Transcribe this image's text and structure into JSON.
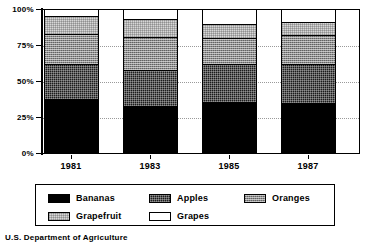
{
  "chart_data": {
    "type": "bar",
    "subtype": "stacked-percent",
    "title": "",
    "subtitle": "",
    "xlabel": "",
    "ylabel": "",
    "categories": [
      "1981",
      "1983",
      "1985",
      "1987"
    ],
    "ylim": [
      0,
      100
    ],
    "yticks": [
      0,
      25,
      50,
      75,
      100
    ],
    "ytick_labels": [
      "0%",
      "25%",
      "50%",
      "75%",
      "100%"
    ],
    "grid": true,
    "grid_axis": "y",
    "legend_position": "bottom",
    "series": [
      {
        "name": "Bananas",
        "color": "#000000",
        "pattern": "solid",
        "values": [
          38,
          33,
          36,
          35
        ]
      },
      {
        "name": "Apples",
        "color": "#1c1c1c",
        "pattern": "dense-dither",
        "values": [
          24,
          25,
          26,
          27
        ]
      },
      {
        "name": "Oranges",
        "color": "#8d8d8d",
        "pattern": "mid-dither",
        "values": [
          21,
          23,
          18,
          20
        ]
      },
      {
        "name": "Grapefruit",
        "color": "#d7d7d7",
        "pattern": "light-dither",
        "values": [
          12,
          12,
          10,
          9
        ]
      },
      {
        "name": "Grapes",
        "color": "#ffffff",
        "pattern": "none",
        "values": [
          5,
          7,
          10,
          9
        ]
      }
    ],
    "annotations": [
      "U.S. Department of Agriculture"
    ]
  },
  "axis": {
    "y_labels": [
      "100%",
      "75%",
      "50%",
      "25%",
      "0%"
    ],
    "x_labels": [
      "1981",
      "1983",
      "1985",
      "1987"
    ]
  },
  "legend": {
    "items": [
      {
        "label": "Bananas"
      },
      {
        "label": "Apples"
      },
      {
        "label": "Oranges"
      },
      {
        "label": "Grapefruit"
      },
      {
        "label": "Grapes"
      }
    ]
  },
  "source": {
    "text": "U.S. Department of Agriculture"
  }
}
